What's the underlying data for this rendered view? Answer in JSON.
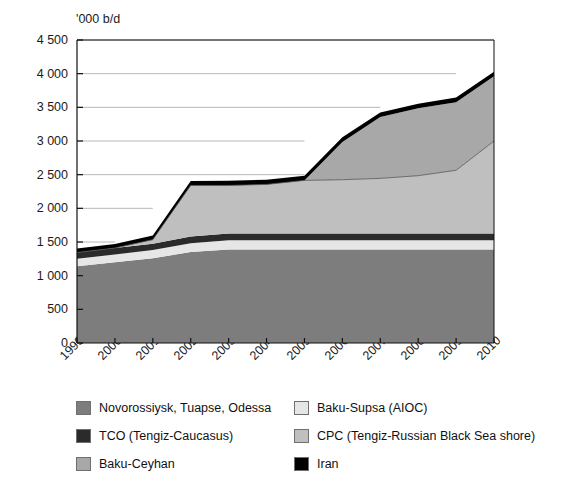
{
  "figure": {
    "cut_off_title_fragment": "",
    "y_axis_unit": "'000 b/d"
  },
  "chart_data": {
    "type": "area",
    "stacked": true,
    "title": "",
    "xlabel": "",
    "ylabel": "'000 b/d",
    "ylim": [
      0,
      4500
    ],
    "ytick_step": 500,
    "grid": true,
    "legend_position": "bottom",
    "categories": [
      "1999",
      "2000",
      "2001",
      "2002",
      "2003",
      "2004",
      "2005",
      "2006",
      "2007",
      "2008",
      "2009",
      "2010"
    ],
    "ytick_labels": [
      "0",
      "500",
      "1 000",
      "1 500",
      "2 000",
      "2 500",
      "3 000",
      "3 500",
      "4 000",
      "4 500"
    ],
    "ytick_values": [
      0,
      500,
      1000,
      1500,
      2000,
      2500,
      3000,
      3500,
      4000,
      4500
    ],
    "series": [
      {
        "name": "Novorossiysk, Tuapse, Odessa",
        "color": "#7d7d7d",
        "values": [
          1140,
          1200,
          1260,
          1350,
          1390,
          1390,
          1390,
          1390,
          1390,
          1390,
          1390,
          1390
        ]
      },
      {
        "name": "Baku-Supsa (AIOC)",
        "color": "#e6e6e6",
        "values": [
          110,
          115,
          120,
          130,
          135,
          135,
          135,
          135,
          135,
          135,
          135,
          135
        ]
      },
      {
        "name": "TCO (Tengiz-Caucasus)",
        "color": "#2b2b2b",
        "values": [
          95,
          95,
          95,
          100,
          100,
          100,
          100,
          100,
          100,
          100,
          100,
          100
        ]
      },
      {
        "name": "CPC (Tengiz-Russian Black Sea shore)",
        "color": "#bfbfbf",
        "values": [
          0,
          0,
          60,
          760,
          715,
          730,
          790,
          800,
          820,
          860,
          940,
          1375
        ]
      },
      {
        "name": "Baku-Ceyhan",
        "color": "#a8a8a8",
        "values": [
          0,
          0,
          0,
          0,
          0,
          0,
          0,
          560,
          910,
          1000,
          1010,
          960
        ]
      },
      {
        "name": "Iran",
        "color": "#000000",
        "values": [
          60,
          60,
          60,
          65,
          70,
          70,
          70,
          70,
          70,
          70,
          70,
          70
        ]
      }
    ],
    "totals": [
      1405,
      1470,
      1595,
      2405,
      2410,
      2425,
      2485,
      3055,
      3425,
      3555,
      3645,
      4030
    ]
  },
  "legend": {
    "left_column": [
      {
        "label": "Novorossiysk, Tuapse, Odessa",
        "color": "#7d7d7d"
      },
      {
        "label": "TCO (Tengiz-Caucasus)",
        "color": "#2b2b2b"
      },
      {
        "label": "Baku-Ceyhan",
        "color": "#a8a8a8"
      }
    ],
    "right_column": [
      {
        "label": "Baku-Supsa (AIOC)",
        "color": "#e6e6e6"
      },
      {
        "label": "CPC (Tengiz-Russian Black Sea shore)",
        "color": "#bfbfbf"
      },
      {
        "label": "Iran",
        "color": "#000000"
      }
    ]
  }
}
